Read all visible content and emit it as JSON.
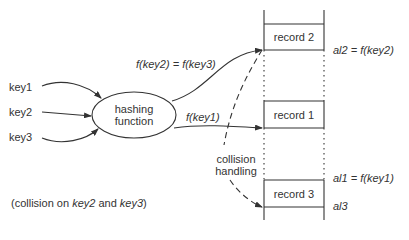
{
  "keys": [
    "key1",
    "key2",
    "key3"
  ],
  "hash_function": {
    "line1": "hashing",
    "line2": "function"
  },
  "arrows": {
    "upper": "f(key2) = f(key3)",
    "lower": "f(key1)"
  },
  "collision_handling": {
    "line1": "collision",
    "line2": "handling"
  },
  "records": [
    "record 2",
    "record 1",
    "record 3"
  ],
  "addresses": {
    "al2": "al2 = f(key2)",
    "al1": "al1 = f(key1)",
    "al3": "al3"
  },
  "note": {
    "prefix": "(collision on ",
    "k1": "key2",
    "mid": " and ",
    "k2": "key3",
    "suffix": ")"
  },
  "colors": {
    "ink": "#333333",
    "background": "#ffffff"
  }
}
